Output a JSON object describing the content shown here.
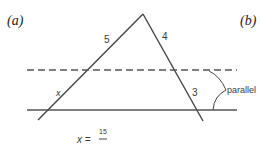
{
  "panels": {
    "left": "(a)",
    "right": "(b)"
  },
  "diagram": {
    "labels": {
      "upper_left_side": "5",
      "upper_right_side": "4",
      "lower_left_side": "x",
      "lower_right_side": "3",
      "bracket": "parallel"
    },
    "equation": {
      "lhs": "x =",
      "numerator": "15",
      "denominator": ""
    },
    "colors": {
      "line": "#444444",
      "dashed": "#555555",
      "text": "#333333"
    }
  }
}
